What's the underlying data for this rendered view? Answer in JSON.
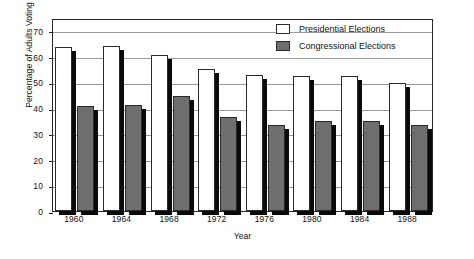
{
  "chart_data": {
    "type": "bar",
    "title": "",
    "xlabel": "Year",
    "ylabel": "Percentage of Adults Voting",
    "categories": [
      "1960",
      "1964",
      "1968",
      "1972",
      "1976",
      "1980",
      "1984",
      "1988"
    ],
    "ylim": [
      0,
      75
    ],
    "yticks": [
      0,
      10,
      20,
      30,
      40,
      50,
      60,
      70
    ],
    "ytick_labels": [
      "0",
      "10",
      "20",
      "30",
      "40",
      "50",
      "60",
      "70"
    ],
    "grid": true,
    "legend_position": "top-right-inside",
    "series": [
      {
        "name": "Presidential Elections",
        "color": "#ffffff",
        "values": [
          63.8,
          64.2,
          60.6,
          55.0,
          53.0,
          52.4,
          52.6,
          49.8
        ]
      },
      {
        "name": "Congressional Elections",
        "color": "#6e6e6e",
        "values": [
          41.0,
          41.2,
          44.6,
          36.4,
          33.4,
          34.8,
          35.0,
          33.4
        ]
      }
    ]
  },
  "legend": {
    "items": [
      {
        "label": "Presidential Elections",
        "swatch": "white-square-icon"
      },
      {
        "label": "Congressional Elections",
        "swatch": "gray-square-icon"
      }
    ]
  },
  "axes": {
    "y_title": "Percentage of Adults Voting",
    "x_title": "Year"
  }
}
